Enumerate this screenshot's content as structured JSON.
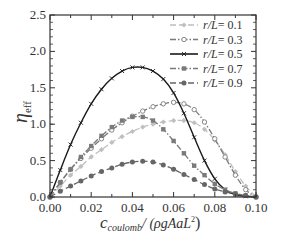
{
  "chart_data": {
    "type": "line",
    "title": "",
    "xlabel": "c_coulomb / (ρgAaL²)",
    "ylabel": "η_eff",
    "xlim": [
      0.0,
      0.1
    ],
    "ylim": [
      0.0,
      2.5
    ],
    "xticks": [
      "0.00",
      "0.02",
      "0.04",
      "0.06",
      "0.08",
      "0.10"
    ],
    "yticks": [
      "0.0",
      "0.5",
      "1.0",
      "1.5",
      "2.0",
      "2.5"
    ],
    "grid": false,
    "legend_position": "upper right",
    "series": [
      {
        "name": "r/L= 0.1",
        "style": "dashed",
        "color": "#bfbfbf",
        "marker": "diamond",
        "x": [
          0.0,
          0.005,
          0.01,
          0.015,
          0.02,
          0.025,
          0.03,
          0.035,
          0.04,
          0.045,
          0.05,
          0.055,
          0.06,
          0.065,
          0.07,
          0.075,
          0.08,
          0.085,
          0.09,
          0.095,
          0.1
        ],
        "y": [
          0.0,
          0.15,
          0.3,
          0.42,
          0.55,
          0.65,
          0.75,
          0.83,
          0.9,
          0.96,
          1.0,
          1.03,
          1.05,
          1.05,
          1.02,
          0.93,
          0.78,
          0.58,
          0.35,
          0.15,
          0.0
        ]
      },
      {
        "name": "r/L= 0.3",
        "style": "dashdot",
        "color": "#7a7a7a",
        "marker": "open-circle",
        "x": [
          0.0,
          0.005,
          0.01,
          0.015,
          0.02,
          0.025,
          0.03,
          0.035,
          0.04,
          0.045,
          0.05,
          0.055,
          0.06,
          0.065,
          0.07,
          0.075,
          0.08,
          0.085,
          0.09,
          0.095,
          0.1
        ],
        "y": [
          0.0,
          0.2,
          0.38,
          0.53,
          0.67,
          0.8,
          0.92,
          1.02,
          1.11,
          1.18,
          1.24,
          1.28,
          1.3,
          1.28,
          1.2,
          1.03,
          0.8,
          0.55,
          0.3,
          0.1,
          0.0
        ]
      },
      {
        "name": "r/L= 0.5",
        "style": "solid",
        "color": "#1a1a1a",
        "marker": "x",
        "x": [
          0.0,
          0.005,
          0.01,
          0.015,
          0.02,
          0.025,
          0.03,
          0.035,
          0.04,
          0.045,
          0.05,
          0.055,
          0.06,
          0.065,
          0.07,
          0.075,
          0.08,
          0.085,
          0.09,
          0.095,
          0.1
        ],
        "y": [
          0.0,
          0.37,
          0.72,
          1.02,
          1.28,
          1.48,
          1.63,
          1.73,
          1.78,
          1.78,
          1.73,
          1.62,
          1.43,
          1.15,
          0.82,
          0.5,
          0.25,
          0.1,
          0.03,
          0.01,
          0.0
        ]
      },
      {
        "name": "r/L= 0.7",
        "style": "dashdot",
        "color": "#7a7a7a",
        "marker": "square",
        "x": [
          0.0,
          0.005,
          0.01,
          0.015,
          0.02,
          0.025,
          0.03,
          0.035,
          0.04,
          0.045,
          0.05,
          0.055,
          0.06,
          0.065,
          0.07,
          0.075,
          0.08,
          0.085,
          0.09,
          0.095,
          0.1
        ],
        "y": [
          0.0,
          0.2,
          0.38,
          0.55,
          0.7,
          0.84,
          0.96,
          1.05,
          1.1,
          1.1,
          1.05,
          0.93,
          0.77,
          0.6,
          0.43,
          0.3,
          0.18,
          0.1,
          0.05,
          0.02,
          0.0
        ]
      },
      {
        "name": "r/L= 0.9",
        "style": "dashed",
        "color": "#666666",
        "marker": "filled-circle",
        "x": [
          0.0,
          0.005,
          0.01,
          0.015,
          0.02,
          0.025,
          0.03,
          0.035,
          0.04,
          0.045,
          0.05,
          0.055,
          0.06,
          0.065,
          0.07,
          0.075,
          0.08,
          0.085,
          0.09,
          0.095,
          0.1
        ],
        "y": [
          0.0,
          0.08,
          0.15,
          0.22,
          0.29,
          0.35,
          0.4,
          0.45,
          0.48,
          0.49,
          0.48,
          0.44,
          0.38,
          0.31,
          0.24,
          0.17,
          0.11,
          0.07,
          0.04,
          0.02,
          0.0
        ]
      }
    ]
  },
  "axes": {
    "ylabel_main": "η",
    "ylabel_sub": "eff",
    "xlabel_c": "c",
    "xlabel_sub": "coulomb",
    "xlabel_rest": "/ (ρgAaL",
    "xlabel_sup": "2",
    "xlabel_close": ")"
  },
  "legend": [
    {
      "label": "r/L= 0.1"
    },
    {
      "label": "r/L= 0.3"
    },
    {
      "label": "r/L= 0.5"
    },
    {
      "label": "r/L= 0.7"
    },
    {
      "label": "r/L= 0.9"
    }
  ]
}
